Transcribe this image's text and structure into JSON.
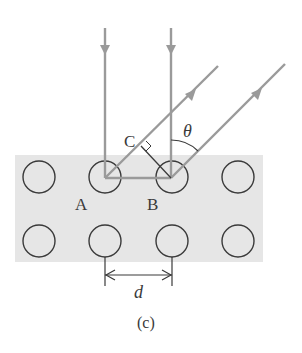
{
  "figure": {
    "caption": "(c)",
    "labels": {
      "point_a": "A",
      "point_b": "B",
      "point_c": "C",
      "angle": "θ",
      "spacing": "d"
    },
    "colors": {
      "background": "#ffffff",
      "crystal_fill": "#e6e6e6",
      "ray": "#9a9a9a",
      "atom_stroke": "#3a3a3a",
      "text": "#3a3a3a"
    },
    "atoms": {
      "rows": 2,
      "columns": 4
    }
  }
}
